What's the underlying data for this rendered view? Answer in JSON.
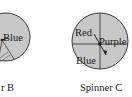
{
  "spinner_b": {
    "caption": "Spinner B",
    "caption_visible": "r B",
    "labels": [
      "Blue"
    ]
  },
  "spinner_c": {
    "caption": "Spinner C",
    "labels": {
      "top_left": "Red",
      "right": "Purple",
      "bottom_left": "Blue"
    }
  },
  "colors": {
    "fill": "#c8c8c8",
    "stroke": "#3a3a3a",
    "text": "#1a1a1a"
  }
}
